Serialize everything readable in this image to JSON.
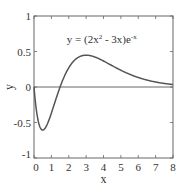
{
  "chart_data": {
    "type": "line",
    "title": "",
    "annotation": {
      "text_prefix": "y = (2x",
      "text_sup1": "2",
      "text_mid": " - 3x)e",
      "text_sup2": "-x",
      "x": 3.9,
      "y": 0.62
    },
    "xlabel": "x",
    "ylabel": "y",
    "xlim": [
      0,
      8
    ],
    "ylim": [
      -1,
      1
    ],
    "xticks": [
      0,
      1,
      2,
      3,
      4,
      5,
      6,
      7,
      8
    ],
    "xtick_labels": [
      "0",
      "1",
      "2",
      "3",
      "4",
      "5",
      "6",
      "7",
      "8"
    ],
    "yticks": [
      -1,
      -0.5,
      0,
      0.5,
      1
    ],
    "ytick_labels": [
      "-1",
      "-0.5",
      "0",
      "0.5",
      "1"
    ],
    "grid": false,
    "legend": null,
    "reference_lines": [
      {
        "axis": "y",
        "value": 0
      }
    ],
    "series": [
      {
        "name": "y = (2x^2 - 3x)e^-x",
        "x": [
          0,
          0.25,
          0.5,
          0.75,
          1,
          1.25,
          1.5,
          1.75,
          2,
          2.5,
          3,
          3.5,
          4,
          4.5,
          5,
          5.5,
          6,
          6.5,
          7,
          7.5,
          8
        ],
        "y": [
          0,
          -0.487,
          -0.607,
          -0.531,
          -0.368,
          -0.179,
          0,
          0.149,
          0.271,
          0.411,
          0.448,
          0.423,
          0.366,
          0.3,
          0.236,
          0.18,
          0.134,
          0.097,
          0.07,
          0.05,
          0.035
        ]
      }
    ]
  },
  "colors": {
    "line": "#555555",
    "axis": "#666666",
    "text": "#333333"
  }
}
